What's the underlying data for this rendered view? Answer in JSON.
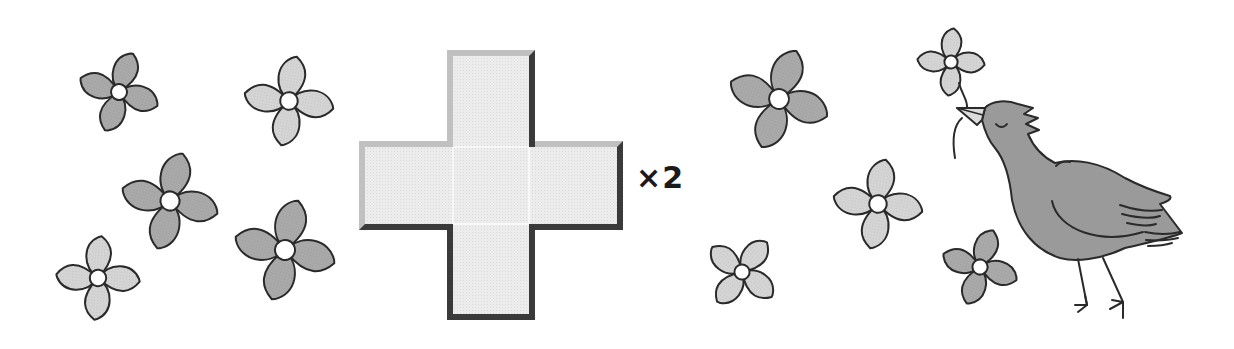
{
  "multiplier_label": "×2",
  "colors": {
    "outline": "#2a2a2a",
    "flower_dark": "#a9a9a9",
    "flower_light": "#d4d4d4",
    "flower_center": "#ffffff",
    "bird_body": "#9a9a9a",
    "cross_fill": "#ececec",
    "cross_bevel_light": "#c4c4c4",
    "cross_bevel_dark": "#3a3a3a"
  },
  "flowers": [
    {
      "id": 1,
      "cx": 119,
      "cy": 92,
      "size": 40,
      "rotate": 20,
      "shade": "dark"
    },
    {
      "id": 2,
      "cx": 289,
      "cy": 101,
      "size": 44,
      "rotate": 10,
      "shade": "light"
    },
    {
      "id": 3,
      "cx": 170,
      "cy": 201,
      "size": 48,
      "rotate": 15,
      "shade": "dark"
    },
    {
      "id": 4,
      "cx": 98,
      "cy": 278,
      "size": 41,
      "rotate": 5,
      "shade": "light"
    },
    {
      "id": 5,
      "cx": 285,
      "cy": 250,
      "size": 50,
      "rotate": 15,
      "shade": "dark"
    },
    {
      "id": 6,
      "cx": 779,
      "cy": 99,
      "size": 50,
      "rotate": 20,
      "shade": "dark"
    },
    {
      "id": 7,
      "cx": 878,
      "cy": 204,
      "size": 44,
      "rotate": 10,
      "shade": "light"
    },
    {
      "id": 8,
      "cx": 742,
      "cy": 272,
      "size": 38,
      "rotate": 40,
      "shade": "light"
    },
    {
      "id": 9,
      "cx": 951,
      "cy": 62,
      "size": 33,
      "rotate": 5,
      "shade": "light"
    },
    {
      "id": 10,
      "cx": 980,
      "cy": 267,
      "size": 38,
      "rotate": 20,
      "shade": "dark"
    }
  ],
  "cross": {
    "vertical": {
      "x": 447,
      "y": 50,
      "w": 88,
      "h": 270
    },
    "horizontal": {
      "x": 359,
      "y": 141,
      "w": 264,
      "h": 89
    }
  }
}
